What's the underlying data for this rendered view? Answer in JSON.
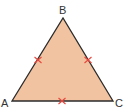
{
  "diagram": {
    "type": "equilateral-triangle",
    "vertices": [
      {
        "label": "A",
        "x": 12,
        "y": 101
      },
      {
        "label": "B",
        "x": 63,
        "y": 18
      },
      {
        "label": "C",
        "x": 113,
        "y": 101
      }
    ],
    "labels": {
      "A": "A",
      "B": "B",
      "C": "C"
    },
    "fill_color": "#f2c3a0",
    "stroke_color": "#2b2b2b",
    "tick_color": "#e8453c",
    "tick_marks": [
      {
        "side": "AB",
        "x": 38,
        "y": 60
      },
      {
        "side": "BC",
        "x": 88,
        "y": 60
      },
      {
        "side": "AC",
        "x": 62,
        "y": 101
      }
    ]
  }
}
